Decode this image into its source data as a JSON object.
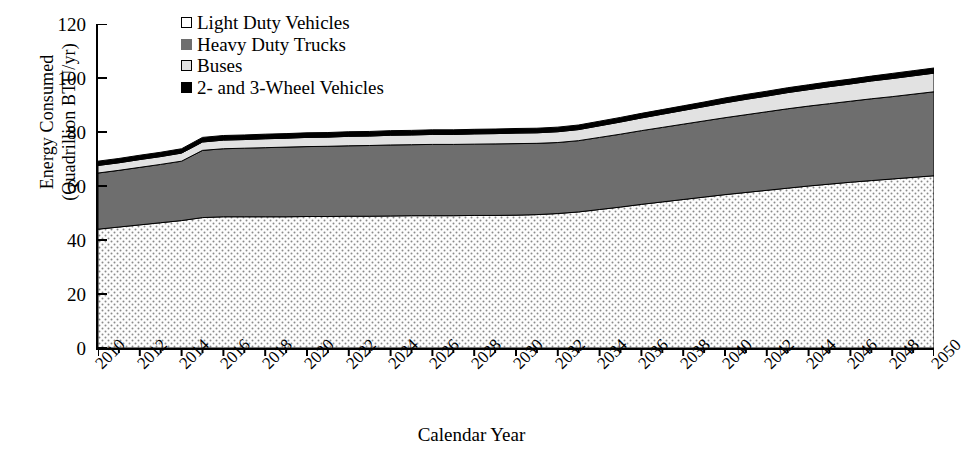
{
  "chart_data": {
    "type": "area",
    "title": "",
    "xlabel": "Calendar Year",
    "ylabel": "Energy Consumed\n(Quadrillion BTU/yr)",
    "ylim": [
      0,
      120
    ],
    "yticks": [
      0,
      20,
      40,
      60,
      80,
      100,
      120
    ],
    "xlim": [
      2010,
      2050
    ],
    "xticks": [
      2010,
      2012,
      2014,
      2016,
      2018,
      2020,
      2022,
      2024,
      2026,
      2028,
      2030,
      2032,
      2034,
      2036,
      2038,
      2040,
      2042,
      2044,
      2046,
      2048,
      2050
    ],
    "minor_xtick_step": 1,
    "grid": false,
    "stacked": true,
    "legend_position": "top-left",
    "x": [
      2010,
      2011,
      2012,
      2013,
      2014,
      2015,
      2016,
      2017,
      2018,
      2019,
      2020,
      2021,
      2022,
      2023,
      2024,
      2025,
      2026,
      2027,
      2028,
      2029,
      2030,
      2031,
      2032,
      2033,
      2034,
      2035,
      2036,
      2037,
      2038,
      2039,
      2040,
      2041,
      2042,
      2043,
      2044,
      2045,
      2046,
      2047,
      2048,
      2049,
      2050
    ],
    "series": [
      {
        "name": "Light Duty Vehicles",
        "fill": "dotted-stipple",
        "color": "#f2f2f2",
        "values": [
          44.0,
          44.8,
          45.6,
          46.4,
          47.2,
          48.3,
          48.6,
          48.6,
          48.6,
          48.6,
          48.7,
          48.7,
          48.8,
          48.8,
          48.9,
          49.0,
          49.0,
          49.0,
          49.1,
          49.1,
          49.2,
          49.4,
          49.8,
          50.4,
          51.3,
          52.2,
          53.2,
          54.1,
          55.0,
          55.9,
          56.8,
          57.6,
          58.4,
          59.2,
          60.0,
          60.7,
          61.4,
          62.0,
          62.6,
          63.2,
          63.8
        ]
      },
      {
        "name": "Heavy Duty Trucks",
        "fill": "solid",
        "color": "#6e6e6e",
        "values": [
          20.8,
          21.0,
          21.3,
          21.6,
          22.0,
          24.9,
          25.2,
          25.4,
          25.6,
          25.8,
          25.9,
          26.0,
          26.1,
          26.2,
          26.3,
          26.3,
          26.4,
          26.4,
          26.4,
          26.5,
          26.5,
          26.4,
          26.3,
          26.4,
          26.7,
          27.0,
          27.3,
          27.6,
          27.9,
          28.2,
          28.5,
          28.8,
          29.1,
          29.4,
          29.6,
          29.8,
          30.0,
          30.3,
          30.5,
          30.8,
          31.1
        ]
      },
      {
        "name": "Buses",
        "fill": "solid",
        "color": "#e2e2e2",
        "values": [
          2.8,
          2.8,
          2.9,
          2.9,
          3.0,
          3.1,
          3.2,
          3.2,
          3.3,
          3.3,
          3.4,
          3.4,
          3.5,
          3.5,
          3.6,
          3.6,
          3.7,
          3.7,
          3.8,
          3.8,
          3.9,
          3.9,
          4.0,
          4.1,
          4.3,
          4.5,
          4.7,
          4.9,
          5.1,
          5.3,
          5.5,
          5.7,
          5.8,
          6.0,
          6.1,
          6.3,
          6.4,
          6.6,
          6.7,
          6.8,
          6.9
        ]
      },
      {
        "name": "2- and 3-Wheel Vehicles",
        "fill": "solid",
        "color": "#000000",
        "values": [
          1.6,
          1.6,
          1.6,
          1.6,
          1.6,
          1.7,
          1.7,
          1.7,
          1.7,
          1.7,
          1.7,
          1.7,
          1.7,
          1.7,
          1.7,
          1.7,
          1.7,
          1.7,
          1.7,
          1.7,
          1.7,
          1.7,
          1.7,
          1.7,
          1.7,
          1.7,
          1.7,
          1.7,
          1.7,
          1.7,
          1.8,
          1.8,
          1.8,
          1.8,
          1.8,
          1.8,
          1.8,
          1.8,
          1.9,
          1.9,
          1.9
        ]
      }
    ],
    "totals": [
      69.2,
      70.2,
      71.4,
      72.5,
      73.8,
      78.0,
      78.7,
      78.9,
      79.2,
      79.4,
      79.7,
      79.8,
      80.1,
      80.2,
      80.5,
      80.6,
      80.8,
      80.8,
      81.0,
      81.1,
      81.3,
      81.4,
      81.8,
      82.6,
      84.0,
      85.4,
      86.9,
      88.3,
      89.7,
      91.1,
      92.6,
      93.9,
      95.1,
      96.4,
      97.5,
      98.6,
      99.6,
      100.7,
      101.7,
      102.7,
      103.7
    ]
  },
  "axes": {
    "y_title": "Energy Consumed\n(Quadrillion BTU/yr)",
    "x_title": "Calendar Year",
    "y_tick_labels": [
      "120",
      "100",
      "80",
      "60",
      "40",
      "20",
      "0"
    ],
    "x_tick_labels": [
      "2010",
      "2012",
      "2014",
      "2016",
      "2018",
      "2020",
      "2022",
      "2024",
      "2026",
      "2028",
      "2030",
      "2032",
      "2034",
      "2036",
      "2038",
      "2040",
      "2042",
      "2044",
      "2046",
      "2048",
      "2050"
    ]
  },
  "legend": {
    "items": [
      {
        "label": "Light Duty Vehicles",
        "swatch": "dots"
      },
      {
        "label": "Heavy Duty Trucks",
        "swatch": "dk"
      },
      {
        "label": "Buses",
        "swatch": "lt"
      },
      {
        "label": "2- and 3-Wheel Vehicles",
        "swatch": "bk"
      }
    ]
  },
  "colors": {
    "light_duty": "#f2f2f2",
    "heavy_duty": "#6e6e6e",
    "buses": "#e2e2e2",
    "two_three_wheel": "#000000",
    "axis": "#000000",
    "background": "#ffffff"
  },
  "caption_strip": ""
}
